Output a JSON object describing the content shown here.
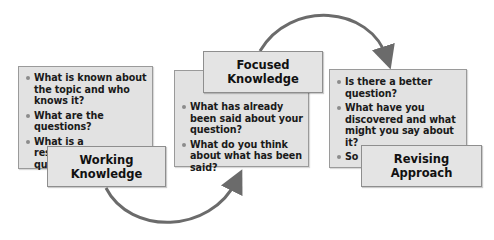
{
  "stages": [
    {
      "title_line1": "Working",
      "title_line2": "Knowledge",
      "bullets": [
        "What is known about the topic and who knows it?",
        "What are the questions?",
        "What is a researchable question?"
      ]
    },
    {
      "title_line1": "Focused",
      "title_line2": "Knowledge",
      "bullets": [
        "What has already been said about your question?",
        "What do you think about what has been said?"
      ]
    },
    {
      "title_line1": "Revising",
      "title_line2": "Approach",
      "bullets": [
        "Is there a better question?",
        "What have you discovered and what might you say about it?",
        "So what?"
      ]
    }
  ],
  "colors": {
    "panel": "#e2e2e2",
    "arrow": "#6b6b6b",
    "bullet": "#8c8c8c"
  }
}
